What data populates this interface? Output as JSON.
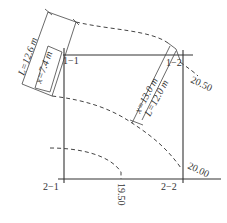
{
  "diagram": {
    "corners": [
      {
        "id": "1-1",
        "label": "1−1"
      },
      {
        "id": "1-2",
        "label": "1−2"
      },
      {
        "id": "2-1",
        "label": "2−1"
      },
      {
        "id": "2-2",
        "label": "2−2"
      }
    ],
    "contours": [
      {
        "id": "c1",
        "label": "20.50"
      },
      {
        "id": "c2",
        "label": "20.00"
      },
      {
        "id": "c3",
        "label": "19.50"
      }
    ],
    "dimensions": {
      "left_outer": "L=12.6 m",
      "left_inner": "x=7.4 m",
      "right_outer": "x=13.0 m",
      "right_inner": "L=12.0 m"
    },
    "colors": {
      "line": "#333333",
      "background": "#ffffff"
    }
  }
}
